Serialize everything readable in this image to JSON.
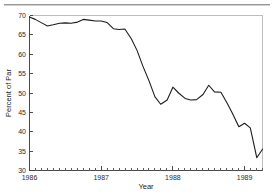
{
  "figure": {
    "background_color": "#ffffff",
    "line_color": "#1c1c1c",
    "axis_color": "#4a4a4a",
    "frame_color": "#bdbdbd"
  },
  "chart_data": {
    "type": "line",
    "title": "",
    "xlabel": "Year",
    "ylabel": "Percent of Par",
    "xlim": [
      1986.0,
      1989.25
    ],
    "ylim": [
      30,
      70
    ],
    "grid": false,
    "legend": null,
    "x_major_ticks": [
      1986,
      1987,
      1988,
      1989
    ],
    "x_major_tick_labels": [
      "1986",
      "1987",
      "1988",
      "1989"
    ],
    "x_minor_tick_interval": 0.08333,
    "y_ticks": [
      30,
      35,
      40,
      45,
      50,
      55,
      60,
      65,
      70
    ],
    "y_tick_labels": [
      "30",
      "35",
      "40",
      "45",
      "50",
      "55",
      "60",
      "65",
      "70"
    ],
    "series": [
      {
        "name": "Percent of Par",
        "x": [
          1986.0,
          1986.08,
          1986.17,
          1986.25,
          1986.33,
          1986.42,
          1986.5,
          1986.58,
          1986.67,
          1986.75,
          1986.83,
          1986.92,
          1987.0,
          1987.08,
          1987.17,
          1987.25,
          1987.33,
          1987.42,
          1987.5,
          1987.58,
          1987.67,
          1987.75,
          1987.83,
          1987.92,
          1988.0,
          1988.08,
          1988.17,
          1988.25,
          1988.33,
          1988.42,
          1988.5,
          1988.58,
          1988.67,
          1988.75,
          1988.83,
          1988.92,
          1989.0,
          1989.08,
          1989.17,
          1989.25
        ],
        "y": [
          69.6,
          69.0,
          68.1,
          67.3,
          67.6,
          68.0,
          68.1,
          68.0,
          68.3,
          69.0,
          68.8,
          68.6,
          68.6,
          68.2,
          66.6,
          66.4,
          66.5,
          64.0,
          61.0,
          57.0,
          53.0,
          49.0,
          47.1,
          48.2,
          51.5,
          50.0,
          48.6,
          48.2,
          48.3,
          49.6,
          52.0,
          50.3,
          50.2,
          47.6,
          44.8,
          41.3,
          42.2,
          41.0,
          33.3,
          35.5
        ]
      }
    ],
    "annotations": []
  }
}
